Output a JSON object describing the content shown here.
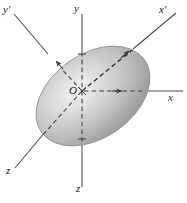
{
  "figure": {
    "background_color": "#ffffff",
    "ink_color": "#2b2b2b",
    "body": {
      "shape": "ellipse",
      "name": "ellipsoid",
      "center_x": 93,
      "center_y": 96,
      "semi_major": 63,
      "semi_minor": 42,
      "rotation_deg": -35,
      "fill_light": "#f2f2f2",
      "fill_mid": "#bdbdbd",
      "fill_dark": "#8e8e8e",
      "outline_color": "#8a8a8a"
    },
    "axes": [
      {
        "id": "x",
        "label": "x",
        "label_x": 169,
        "label_y": 98,
        "orientation": "horizontal-right",
        "style_inside": "dashed",
        "style_outside": "solid",
        "arrowhead": true
      },
      {
        "id": "y",
        "label": "y",
        "label_x": 74,
        "label_y": 5,
        "orientation": "vertical-up",
        "style_inside": "dashed",
        "style_outside": "solid",
        "arrowhead": false
      },
      {
        "id": "z-prime",
        "label": "z'",
        "label_x": 77,
        "label_y": 185,
        "orientation": "vertical-down",
        "style_inside": "dashed",
        "style_outside": "solid",
        "arrowhead": false
      },
      {
        "id": "x-prime",
        "label": "x'",
        "label_x": 160,
        "label_y": 6,
        "orientation": "diagonal-up-right",
        "style_inside": "dashed",
        "style_outside": "solid",
        "arrowhead": true
      },
      {
        "id": "y-prime",
        "label": "y'",
        "label_x": 3,
        "label_y": 6,
        "orientation": "diagonal-up-left",
        "style_inside": "dashed",
        "style_outside": "solid",
        "arrowhead": true
      },
      {
        "id": "z",
        "label": "z",
        "label_x": 7,
        "label_y": 167,
        "orientation": "diagonal-down-left",
        "style_inside": "dashed",
        "style_outside": "solid",
        "arrowhead": false
      }
    ],
    "origin": {
      "label": "O",
      "label_x": 70,
      "label_y": 88,
      "x": 82,
      "y": 91
    }
  }
}
